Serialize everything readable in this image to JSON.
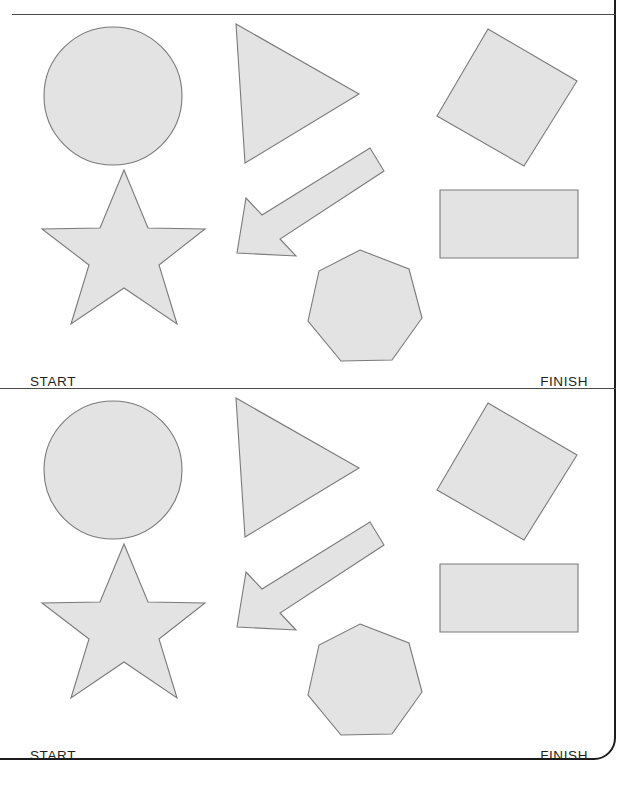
{
  "document": {
    "kind": "worksheet",
    "panel_count": 2,
    "shape_fill": "#e3e3e3",
    "shape_stroke": "#7a7a7a",
    "border_color": "#1c1c1c",
    "rule_color": "#4a4a4a",
    "background": "#ffffff"
  },
  "labels": {
    "start": "START",
    "finish": "FINISH"
  },
  "panels": [
    {
      "id": "panel-top",
      "start_label": "START",
      "finish_label": "FINISH",
      "shapes": [
        {
          "name": "circle",
          "type": "circle",
          "cx": 113,
          "cy": 82,
          "r": 69
        },
        {
          "name": "triangle",
          "type": "polygon",
          "points": "236,10 359,80 245,149"
        },
        {
          "name": "rotated-square",
          "type": "polygon",
          "points": "488,15 577,67 524,152 437,102"
        },
        {
          "name": "five-point-star",
          "type": "polygon",
          "points": "124,156 148,214 205,215 159,251 177,310 124,274 71,310 89,251 42,215 100,214"
        },
        {
          "name": "arrow",
          "type": "polygon",
          "points": "370,134 384,157 280,225 296,242 237,239 246,184 262,201"
        },
        {
          "name": "rectangle",
          "type": "polygon",
          "points": "440,176 578,176 578,244 440,244"
        },
        {
          "name": "heptagon",
          "type": "polygon",
          "points": "360,236 409,255 422,304 392,346 341,347 308,307 319,257"
        }
      ]
    },
    {
      "id": "panel-bottom",
      "start_label": "START",
      "finish_label": "FINISH",
      "shapes": [
        {
          "name": "circle",
          "type": "circle",
          "cx": 113,
          "cy": 82,
          "r": 69
        },
        {
          "name": "triangle",
          "type": "polygon",
          "points": "236,10 359,80 245,149"
        },
        {
          "name": "rotated-square",
          "type": "polygon",
          "points": "488,15 577,67 524,152 437,102"
        },
        {
          "name": "five-point-star",
          "type": "polygon",
          "points": "124,156 148,214 205,215 159,251 177,310 124,274 71,310 89,251 42,215 100,214"
        },
        {
          "name": "arrow",
          "type": "polygon",
          "points": "370,134 384,157 280,225 296,242 237,239 246,184 262,201"
        },
        {
          "name": "rectangle",
          "type": "polygon",
          "points": "440,176 578,176 578,244 440,244"
        },
        {
          "name": "heptagon",
          "type": "polygon",
          "points": "360,236 409,255 422,304 392,346 341,347 308,307 319,257"
        }
      ]
    }
  ]
}
